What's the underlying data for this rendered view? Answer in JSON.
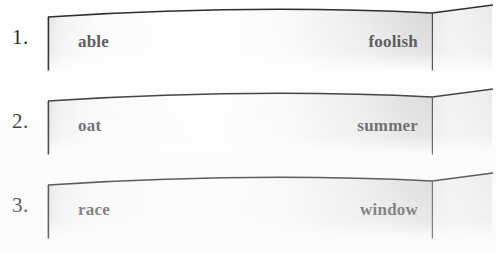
{
  "worksheet": {
    "background_color": "#fefefe",
    "number_color": "#1b1b1b",
    "word_color": "#555559",
    "strip_edge_color": "#2a2a2a",
    "strip_fill_light": "#fdfdfd",
    "strip_fill_shadow": "#d3d3d3",
    "rows": [
      {
        "number": "1.",
        "left_word": "able",
        "right_word": "foolish",
        "shape": "curved-paper-strip",
        "fold_icon": "fold-crease-icon"
      },
      {
        "number": "2.",
        "left_word": "oat",
        "right_word": "summer",
        "shape": "curved-paper-strip",
        "fold_icon": "fold-crease-icon"
      },
      {
        "number": "3.",
        "left_word": "race",
        "right_word": "window",
        "shape": "curved-paper-strip",
        "fold_icon": "fold-crease-icon"
      }
    ]
  }
}
